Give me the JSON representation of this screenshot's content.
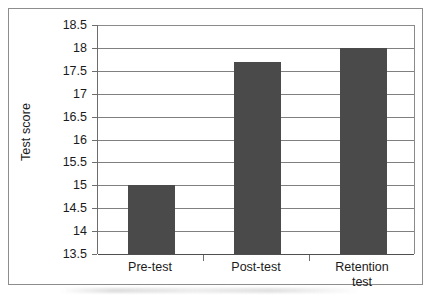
{
  "chart_data": {
    "type": "bar",
    "title": "",
    "xlabel": "",
    "ylabel": "Test score",
    "categories": [
      "Pre-test",
      "Post-test",
      "Retention test"
    ],
    "category_label_lines": [
      [
        "Pre-test"
      ],
      [
        "Post-test"
      ],
      [
        "Retention",
        "test"
      ]
    ],
    "values": [
      15.0,
      17.7,
      18.0
    ],
    "ylim": [
      13.5,
      18.5
    ],
    "ytick_step": 0.5,
    "ytick_labels": [
      "18.5",
      "18",
      "17.5",
      "17",
      "16.5",
      "16",
      "15.5",
      "15",
      "14.5",
      "14",
      "13.5"
    ],
    "ytick_values": [
      18.5,
      18,
      17.5,
      17,
      16.5,
      16,
      15.5,
      15,
      14.5,
      14,
      13.5
    ],
    "grid": true,
    "legend": false,
    "legend_position": "none",
    "bar_color": "#4a4a4a",
    "gridline_color": "#808080",
    "axis_color": "#6d6d6d",
    "frame_color": "#8d8d8d",
    "background_color": "#ffffff"
  }
}
